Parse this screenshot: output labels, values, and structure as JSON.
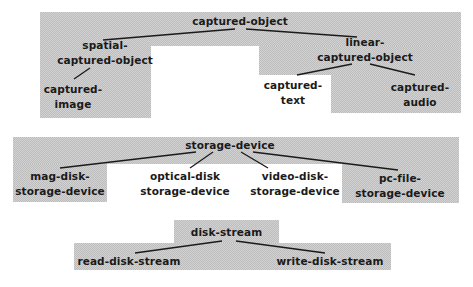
{
  "diagrams": [
    {
      "root": "captured-object",
      "nodes": {
        "root": "captured-object",
        "spatial": "spatial-\ncaptured-object",
        "image": "captured-\nimage",
        "linear": "linear-\ncaptured-object",
        "text": "captured-\ntext",
        "audio": "captured-\naudio"
      },
      "edges": [
        [
          "captured-object",
          "spatial-captured-object"
        ],
        [
          "captured-object",
          "linear-captured-object"
        ],
        [
          "spatial-captured-object",
          "captured-image"
        ],
        [
          "linear-captured-object",
          "captured-text"
        ],
        [
          "linear-captured-object",
          "captured-audio"
        ]
      ]
    },
    {
      "root": "storage-device",
      "nodes": {
        "root": "storage-device",
        "mag": "mag-disk-\nstorage-device",
        "optical": "optical-disk\nstorage-device",
        "video": "video-disk-\nstorage-device",
        "pcfile": "pc-file-\nstorage-device"
      },
      "edges": [
        [
          "storage-device",
          "mag-disk-storage-device"
        ],
        [
          "storage-device",
          "optical-disk-storage-device"
        ],
        [
          "storage-device",
          "video-disk-storage-device"
        ],
        [
          "storage-device",
          "pc-file-storage-device"
        ]
      ]
    },
    {
      "root": "disk-stream",
      "nodes": {
        "root": "disk-stream",
        "read": "read-disk-stream",
        "write": "write-disk-stream"
      },
      "edges": [
        [
          "disk-stream",
          "read-disk-stream"
        ],
        [
          "disk-stream",
          "write-disk-stream"
        ]
      ]
    }
  ],
  "colors": {
    "shade": "#cfcfcf",
    "text": "#1a1a1a",
    "background": "#ffffff"
  }
}
